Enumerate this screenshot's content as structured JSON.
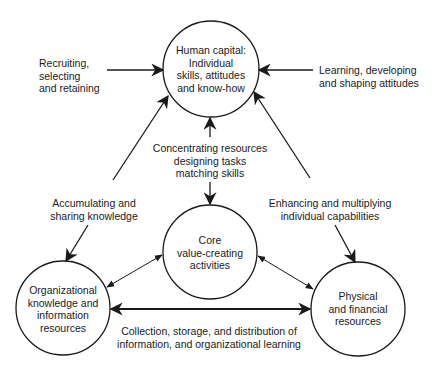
{
  "diagram": {
    "colors": {
      "stroke": "#1a1a1a",
      "text": "#1a1a1a",
      "background": "#ffffff"
    },
    "nodes": {
      "human_capital": {
        "label": "Human capital:\nIndividual\nskills, attitudes\nand know-how"
      },
      "core": {
        "label": "Core\nvalue-creating\nactivities"
      },
      "org_knowledge": {
        "label": "Organizational\nknowledge and\ninformation\nresources"
      },
      "physical": {
        "label": "Physical\nand financial\nresources"
      }
    },
    "edge_labels": {
      "recruiting": "Recruiting,\nselecting\nand retaining",
      "learning": "Learning, developing\nand shaping attitudes",
      "concentrating": "Concentrating resources\ndesigning tasks\nmatching skills",
      "accumulating": "Accumulating and\nsharing knowledge",
      "enhancing": "Enhancing and multiplying\nindividual capabilities",
      "collection": "Collection, storage, and distribution of\ninformation, and organizational learning"
    },
    "edges": [
      {
        "from": "recruiting",
        "to": "human_capital",
        "direction": "one-way"
      },
      {
        "from": "learning",
        "to": "human_capital",
        "direction": "one-way"
      },
      {
        "from": "concentrating",
        "to": "human_capital",
        "direction": "one-way"
      },
      {
        "from": "concentrating",
        "to": "core",
        "direction": "one-way"
      },
      {
        "from": "org_knowledge",
        "to": "human_capital",
        "direction": "two-way",
        "label": "accumulating"
      },
      {
        "from": "physical",
        "to": "human_capital",
        "direction": "two-way",
        "label": "enhancing"
      },
      {
        "from": "core",
        "to": "org_knowledge",
        "direction": "two-way"
      },
      {
        "from": "core",
        "to": "physical",
        "direction": "two-way"
      },
      {
        "from": "org_knowledge",
        "to": "physical",
        "direction": "two-way",
        "label": "collection"
      }
    ]
  }
}
